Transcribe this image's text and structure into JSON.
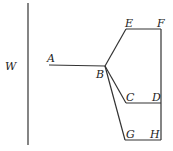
{
  "diagram": {
    "labels": {
      "W": "W",
      "A": "A",
      "B": "B",
      "C": "C",
      "D": "D",
      "E": "E",
      "F": "F",
      "G": "G",
      "H": "H"
    },
    "points": {
      "A": [
        49,
        65
      ],
      "B": [
        105,
        66
      ],
      "C": [
        126,
        103
      ],
      "D": [
        161,
        103
      ],
      "E": [
        126,
        29
      ],
      "F": [
        161,
        29
      ],
      "G": [
        125,
        140
      ],
      "H": [
        161,
        140
      ]
    },
    "wall": {
      "x": 28,
      "y1": 3,
      "y2": 145
    },
    "colors": {
      "line": "#333333",
      "text": "#222222",
      "background": "#ffffff"
    }
  }
}
